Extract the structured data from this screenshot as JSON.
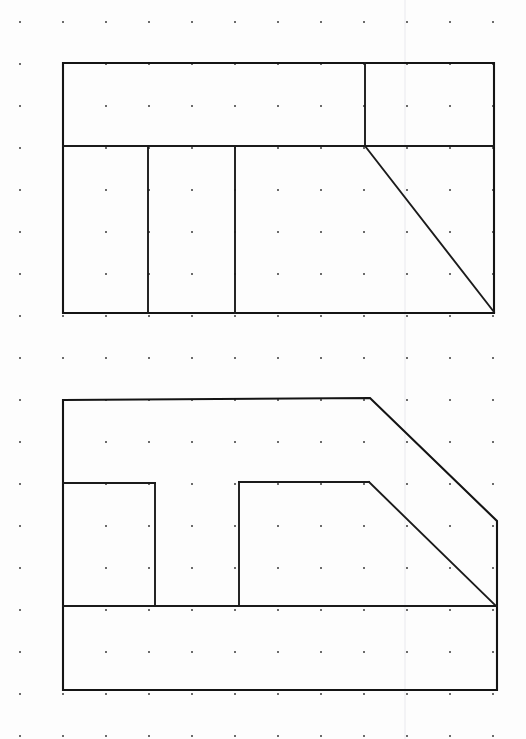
{
  "sheet": {
    "title": "Orthographic Sketch on Dot Grid Paper",
    "width": 526,
    "height": 739,
    "background_color": "#fdfdfd",
    "ink_color": "#141414",
    "dot_color": "#3a3a3a",
    "crease_color": "#e9e9ee",
    "line_width": 2.1
  },
  "grid": {
    "name": "dot-grid",
    "dot_radius": 1.0,
    "x_start": 20,
    "y_start": 22,
    "x_spacing": 43,
    "y_spacing": 42,
    "columns": 12,
    "rows": 18,
    "visible": true
  },
  "crease": {
    "name": "page-crease",
    "x": 405,
    "y_top": 0,
    "y_bottom": 739,
    "visible": true
  },
  "drawing": {
    "type": "orthographic-projection",
    "view_count": 2,
    "units": "grid squares",
    "views": [
      {
        "id": "top-view",
        "label": "Top View",
        "bounds": {
          "x": 63,
          "y": 63,
          "width": 431,
          "height": 251
        },
        "outline": [
          [
            63,
            63
          ],
          [
            494,
            63
          ],
          [
            494,
            313
          ],
          [
            63,
            313
          ]
        ],
        "interior_lines": [
          {
            "name": "horizontal-divider",
            "from": [
              63,
              146
            ],
            "to": [
              494,
              146
            ]
          },
          {
            "name": "vertical-divider-left",
            "from": [
              148,
              146
            ],
            "to": [
              148,
              313
            ]
          },
          {
            "name": "vertical-divider-mid",
            "from": [
              235,
              146
            ],
            "to": [
              235,
              313
            ]
          },
          {
            "name": "vertical-divider-right",
            "from": [
              365,
              63
            ],
            "to": [
              365,
              146
            ]
          },
          {
            "name": "chamfer-diagonal",
            "from": [
              365,
              146
            ],
            "to": [
              494,
              312
            ]
          }
        ]
      },
      {
        "id": "front-view",
        "label": "Front View",
        "bounds": {
          "x": 63,
          "y": 398,
          "width": 434,
          "height": 292
        },
        "outline": [
          [
            63,
            400
          ],
          [
            370,
            398
          ],
          [
            497,
            521
          ],
          [
            497,
            690
          ],
          [
            63,
            690
          ]
        ],
        "interior_lines": [
          {
            "name": "base-band-top",
            "from": [
              63,
              606
            ],
            "to": [
              497,
              606
            ]
          },
          {
            "name": "slot-left-shelf",
            "from": [
              63,
              483
            ],
            "to": [
              155,
              483
            ]
          },
          {
            "name": "slot-left-wall",
            "from": [
              155,
              483
            ],
            "to": [
              155,
              606
            ]
          },
          {
            "name": "slot-right-wall",
            "from": [
              239,
              482
            ],
            "to": [
              239,
              606
            ]
          },
          {
            "name": "slot-right-shelf",
            "from": [
              239,
              482
            ],
            "to": [
              369,
              482
            ]
          },
          {
            "name": "inner-chamfer-diagonal",
            "from": [
              369,
              482
            ],
            "to": [
              496,
              606
            ]
          }
        ]
      }
    ]
  }
}
